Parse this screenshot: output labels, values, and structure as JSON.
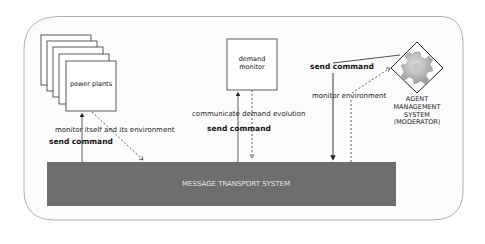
{
  "diagram": {
    "nodes": {
      "power_plants": {
        "label": "power plants"
      },
      "demand_monitor": {
        "label_line1": "demand",
        "label_line2": "monitor"
      },
      "agent_management": {
        "line1": "AGENT",
        "line2": "MANAGEMENT",
        "line3": "SYSTEM",
        "line4": "(MODERATOR)"
      },
      "message_transport": {
        "label": "MESSAGE TRANSPORT SYSTEM"
      }
    },
    "edges": {
      "pp_monitor": "monitor itself and its environment",
      "pp_send": "send command",
      "dm_communicate": "communicate demand evolution",
      "dm_send": "send command",
      "ams_send": "send command",
      "ams_monitor": "monitor environment"
    },
    "colors": {
      "mts_fill": "#6e6e6e",
      "mts_text": "#e6e6e6",
      "frame_stroke": "#9a9a9a",
      "frame_fill": "#fafafa",
      "gear": "#b8b8b8"
    }
  }
}
